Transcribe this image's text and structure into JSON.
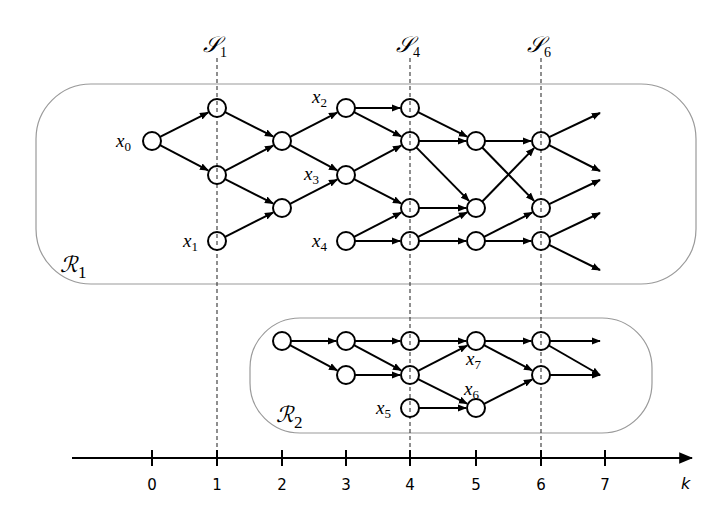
{
  "slices": [
    {
      "id": "S1",
      "symbol": "𝒮",
      "sub": "1",
      "k": 1
    },
    {
      "id": "S4",
      "symbol": "𝒮",
      "sub": "4",
      "k": 4
    },
    {
      "id": "S6",
      "symbol": "𝒮",
      "sub": "6",
      "k": 6
    }
  ],
  "regions": [
    {
      "id": "R1",
      "symbol": "ℛ",
      "sub": "1"
    },
    {
      "id": "R2",
      "symbol": "ℛ",
      "sub": "2"
    }
  ],
  "axis": {
    "label": "k",
    "ticks": [
      "0",
      "1",
      "2",
      "3",
      "4",
      "5",
      "6",
      "7"
    ]
  },
  "node_labels": [
    {
      "name": "x",
      "sub": "0"
    },
    {
      "name": "x",
      "sub": "1"
    },
    {
      "name": "x",
      "sub": "2"
    },
    {
      "name": "x",
      "sub": "3"
    },
    {
      "name": "x",
      "sub": "4"
    },
    {
      "name": "x",
      "sub": "5"
    },
    {
      "name": "x",
      "sub": "6"
    },
    {
      "name": "x",
      "sub": "7"
    }
  ],
  "graph": {
    "r1_nodes": [
      [
        152,
        141
      ],
      [
        217,
        108
      ],
      [
        217,
        175
      ],
      [
        217,
        241
      ],
      [
        282,
        141
      ],
      [
        282,
        208
      ],
      [
        346,
        108
      ],
      [
        346,
        175
      ],
      [
        346,
        241
      ],
      [
        410,
        108
      ],
      [
        410,
        141
      ],
      [
        410,
        208
      ],
      [
        410,
        241
      ],
      [
        476,
        141
      ],
      [
        476,
        208
      ],
      [
        476,
        241
      ],
      [
        541,
        141
      ],
      [
        541,
        208
      ],
      [
        541,
        241
      ]
    ],
    "r2_nodes": [
      [
        282,
        341
      ],
      [
        346,
        341
      ],
      [
        346,
        375
      ],
      [
        410,
        341
      ],
      [
        410,
        375
      ],
      [
        410,
        408
      ],
      [
        476,
        341
      ],
      [
        476,
        408
      ],
      [
        541,
        341
      ],
      [
        541,
        375
      ]
    ],
    "edges": [
      [
        [
          152,
          141
        ],
        [
          217,
          108
        ]
      ],
      [
        [
          152,
          141
        ],
        [
          217,
          175
        ]
      ],
      [
        [
          217,
          108
        ],
        [
          282,
          141
        ]
      ],
      [
        [
          217,
          175
        ],
        [
          282,
          141
        ]
      ],
      [
        [
          217,
          175
        ],
        [
          282,
          208
        ]
      ],
      [
        [
          217,
          241
        ],
        [
          282,
          208
        ]
      ],
      [
        [
          282,
          141
        ],
        [
          346,
          108
        ]
      ],
      [
        [
          282,
          141
        ],
        [
          346,
          175
        ]
      ],
      [
        [
          282,
          208
        ],
        [
          346,
          175
        ]
      ],
      [
        [
          346,
          108
        ],
        [
          410,
          108
        ]
      ],
      [
        [
          346,
          108
        ],
        [
          410,
          141
        ]
      ],
      [
        [
          346,
          175
        ],
        [
          410,
          141
        ]
      ],
      [
        [
          346,
          175
        ],
        [
          410,
          208
        ]
      ],
      [
        [
          346,
          241
        ],
        [
          410,
          208
        ]
      ],
      [
        [
          346,
          241
        ],
        [
          410,
          241
        ]
      ],
      [
        [
          410,
          108
        ],
        [
          476,
          141
        ]
      ],
      [
        [
          410,
          141
        ],
        [
          476,
          141
        ]
      ],
      [
        [
          410,
          141
        ],
        [
          476,
          208
        ]
      ],
      [
        [
          410,
          208
        ],
        [
          476,
          208
        ]
      ],
      [
        [
          410,
          241
        ],
        [
          476,
          208
        ]
      ],
      [
        [
          410,
          241
        ],
        [
          476,
          241
        ]
      ],
      [
        [
          476,
          141
        ],
        [
          541,
          141
        ]
      ],
      [
        [
          476,
          141
        ],
        [
          541,
          208
        ]
      ],
      [
        [
          476,
          208
        ],
        [
          541,
          141
        ]
      ],
      [
        [
          476,
          241
        ],
        [
          541,
          208
        ]
      ],
      [
        [
          476,
          241
        ],
        [
          541,
          241
        ]
      ],
      [
        [
          541,
          141
        ],
        [
          600,
          113
        ]
      ],
      [
        [
          541,
          141
        ],
        [
          600,
          171
        ]
      ],
      [
        [
          541,
          208
        ],
        [
          600,
          180
        ]
      ],
      [
        [
          541,
          241
        ],
        [
          600,
          213
        ]
      ],
      [
        [
          541,
          241
        ],
        [
          600,
          270
        ]
      ],
      [
        [
          282,
          341
        ],
        [
          346,
          341
        ]
      ],
      [
        [
          282,
          341
        ],
        [
          346,
          375
        ]
      ],
      [
        [
          346,
          341
        ],
        [
          410,
          341
        ]
      ],
      [
        [
          346,
          341
        ],
        [
          410,
          375
        ]
      ],
      [
        [
          346,
          375
        ],
        [
          410,
          375
        ]
      ],
      [
        [
          410,
          341
        ],
        [
          476,
          341
        ]
      ],
      [
        [
          410,
          375
        ],
        [
          476,
          341
        ]
      ],
      [
        [
          410,
          375
        ],
        [
          476,
          408
        ]
      ],
      [
        [
          410,
          408
        ],
        [
          476,
          408
        ]
      ],
      [
        [
          476,
          341
        ],
        [
          541,
          341
        ]
      ],
      [
        [
          476,
          341
        ],
        [
          541,
          375
        ]
      ],
      [
        [
          476,
          408
        ],
        [
          541,
          375
        ]
      ],
      [
        [
          541,
          341
        ],
        [
          600,
          341
        ]
      ],
      [
        [
          541,
          341
        ],
        [
          600,
          375
        ]
      ],
      [
        [
          541,
          375
        ],
        [
          600,
          375
        ]
      ]
    ],
    "dotted_nodes": [
      [
        217,
        108
      ],
      [
        217,
        175
      ],
      [
        217,
        241
      ],
      [
        410,
        108
      ],
      [
        410,
        141
      ],
      [
        410,
        208
      ],
      [
        410,
        241
      ],
      [
        541,
        141
      ],
      [
        541,
        208
      ],
      [
        541,
        241
      ],
      [
        410,
        341
      ],
      [
        410,
        375
      ],
      [
        410,
        408
      ],
      [
        541,
        341
      ],
      [
        541,
        375
      ]
    ]
  }
}
